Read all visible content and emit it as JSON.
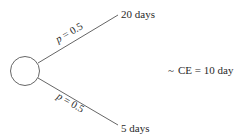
{
  "diagram": {
    "type": "decision-tree-lottery",
    "node": {
      "shape": "circle",
      "label": ""
    },
    "branches": [
      {
        "probability_var": "p",
        "probability_eq": " = 0.5",
        "outcome": "20 days"
      },
      {
        "probability_var": "p",
        "probability_eq": " = 0.5",
        "outcome": "5 days"
      }
    ],
    "certainty_equivalent": {
      "prefix": "~",
      "text": "CE = 10 day"
    },
    "colors": {
      "line": "#555555",
      "text": "#2a2a2a",
      "background": "#ffffff"
    }
  }
}
